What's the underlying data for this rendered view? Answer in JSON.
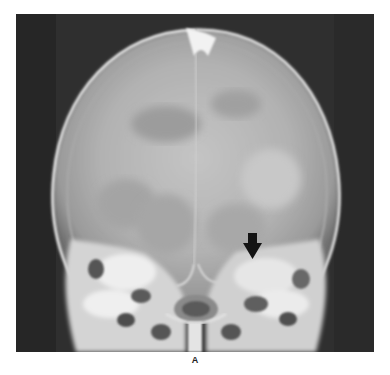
{
  "figure": {
    "type": "x-ray",
    "label": "A",
    "annotation": {
      "type": "arrow",
      "direction": "down",
      "color": "#111111"
    }
  },
  "colors": {
    "background": "#ffffff",
    "film_dark": "#2e2e2e",
    "bone_light": "#e8e8e8"
  }
}
